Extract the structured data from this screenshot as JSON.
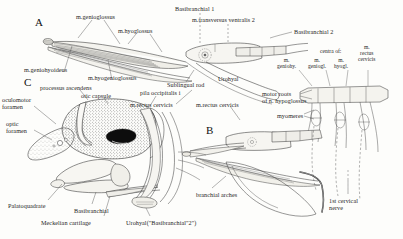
{
  "figure": {
    "kind": "anatomical-line-drawing",
    "panels": [
      {
        "id": "A",
        "letter": "A",
        "x": 35,
        "y": 22
      },
      {
        "id": "B",
        "letter": "B",
        "x": 206,
        "y": 130
      },
      {
        "id": "C",
        "letter": "C",
        "x": 24,
        "y": 82
      }
    ]
  },
  "labels": {
    "a_panel": [
      {
        "key": "m_genioglossus",
        "text": "m.genioglossus",
        "x": 76,
        "y": 13
      },
      {
        "key": "m_hyoglossus",
        "text": "m.hyoglossus",
        "x": 118,
        "y": 27
      },
      {
        "key": "basibranchial_1",
        "text": "Basibranchial 1",
        "x": 175,
        "y": 5
      },
      {
        "key": "m_transversus_ventralis_2",
        "text": "m.transversus ventralis 2",
        "x": 192,
        "y": 16
      },
      {
        "key": "basibranchial_2",
        "text": "Basibranchial 2",
        "x": 294,
        "y": 28
      },
      {
        "key": "m_geniohyoideus",
        "text": "m.geniohyoideus",
        "x": 24,
        "y": 66
      },
      {
        "key": "m_hyogenioglossus",
        "text": "m.hyogenioglossus",
        "x": 88,
        "y": 74
      },
      {
        "key": "sublingual_rod",
        "text": "Sublingual rod",
        "x": 167,
        "y": 81
      },
      {
        "key": "urohyal_a",
        "text": "Urohyal",
        "x": 218,
        "y": 75
      },
      {
        "key": "m_rectus_cervicis_a",
        "text": "m.rectus cervicis",
        "x": 130,
        "y": 101
      }
    ],
    "centra_group": [
      {
        "key": "centra_of",
        "text": "centra of:",
        "x": 320,
        "y": 48
      },
      {
        "key": "m_geniohy",
        "text": "m.\ngeniohy.",
        "x": 277,
        "y": 57
      },
      {
        "key": "m_geniogl",
        "text": "m.\ngeniogl.",
        "x": 308,
        "y": 57
      },
      {
        "key": "m_hyogl",
        "text": "m.\nhyogl.",
        "x": 334,
        "y": 57
      },
      {
        "key": "m_rectus_cervicis_right",
        "text": "m.\nrectus\ncervicis",
        "x": 358,
        "y": 51
      }
    ],
    "b_panel": [
      {
        "key": "motor_roots",
        "text": "motor roots\nof n. hypoglossus",
        "x": 262,
        "y": 90
      },
      {
        "key": "myomeres",
        "text": "myomeres",
        "x": 277,
        "y": 112
      },
      {
        "key": "m_rectus_cervicis_b",
        "text": "m.rectus cervicis",
        "x": 196,
        "y": 101
      },
      {
        "key": "branchial_arches",
        "text": "branchial arches",
        "x": 196,
        "y": 191
      },
      {
        "key": "first_cervical_nerve",
        "text": "1st cervical\nnerve",
        "x": 329,
        "y": 197
      }
    ],
    "c_panel": [
      {
        "key": "processus_ascendens",
        "text": "processus ascendens",
        "x": 40,
        "y": 84
      },
      {
        "key": "otic_capsule",
        "text": "otic capsule",
        "x": 81,
        "y": 92
      },
      {
        "key": "pila_occipitalis",
        "text": "pila occipitalis i",
        "x": 140,
        "y": 89
      },
      {
        "key": "oculomotor_foramen",
        "text": "oculomotor\nforamen",
        "x": 2,
        "y": 96
      },
      {
        "key": "optic_foramen",
        "text": "optic\nforamen",
        "x": 6,
        "y": 120
      },
      {
        "key": "palatoquadrate",
        "text": "Palatoquadrate",
        "x": 8,
        "y": 202
      },
      {
        "key": "basibranchial_c",
        "text": "Basibranchial",
        "x": 74,
        "y": 207
      },
      {
        "key": "meckelian_cartilage",
        "text": "Meckelian cartilage",
        "x": 41,
        "y": 219
      },
      {
        "key": "urohyal_c",
        "text": "Urohyal(\"Basibranchial\"2\")",
        "x": 126,
        "y": 219
      }
    ]
  },
  "colors": {
    "background": "#fdfdfb",
    "ink": "#1f1f1f",
    "line": "#2b2b2b",
    "fill_light": "#f2f1ec",
    "fill_mid": "#dedbd3",
    "fill_dark": "#0d0d0d",
    "leader": "#555555"
  }
}
